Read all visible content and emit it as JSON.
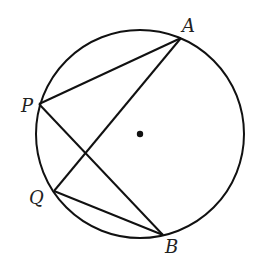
{
  "diagram": {
    "type": "circle-chords",
    "circle": {
      "cx": 140,
      "cy": 134,
      "r": 104
    },
    "center_dot": {
      "x": 140,
      "y": 134
    },
    "points": {
      "A": {
        "label": "A",
        "x": 181,
        "y": 38
      },
      "P": {
        "label": "P",
        "x": 39,
        "y": 104
      },
      "Q": {
        "label": "Q",
        "x": 54,
        "y": 191
      },
      "B": {
        "label": "B",
        "x": 163,
        "y": 235
      }
    },
    "segments": [
      [
        "P",
        "A"
      ],
      [
        "A",
        "Q"
      ],
      [
        "P",
        "B"
      ],
      [
        "Q",
        "B"
      ]
    ],
    "colors": {
      "stroke": "#111111",
      "background": "#ffffff"
    }
  }
}
